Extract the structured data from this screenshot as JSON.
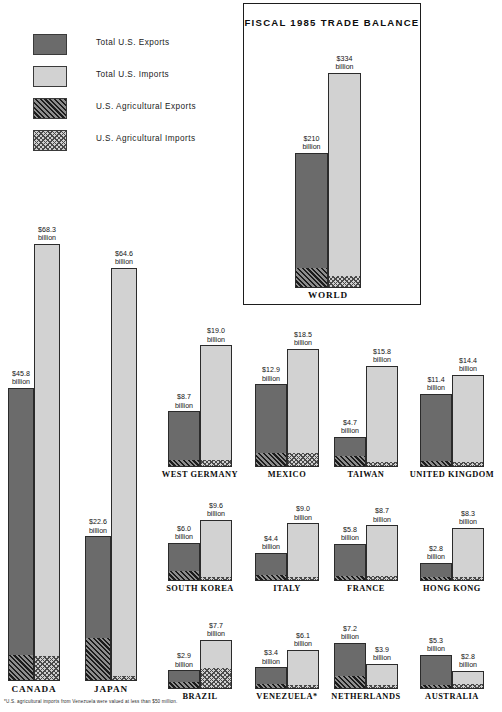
{
  "legend": {
    "items": [
      {
        "label": "Total U.S. Exports",
        "swatch": "exports-swatch",
        "fill": "#6b6b6b"
      },
      {
        "label": "Total U.S. Imports",
        "swatch": "imports-swatch",
        "fill": "#d2d2d2"
      },
      {
        "label": "U.S. Agricultural  Exports",
        "swatch": "ag-exports-swatch",
        "fill": "#5a5a5a"
      },
      {
        "label": "U.S. Agricultural  Imports",
        "swatch": "ag-imports-swatch",
        "fill": "#cfcfcf"
      }
    ]
  },
  "panel": {
    "title": "FISCAL 1985 TRADE BALANCE"
  },
  "footnote": "*U.S. agricultural imports from Venezuela were valued at less than $50 million.",
  "units": "billion",
  "chart_data": {
    "type": "bar",
    "title": "FISCAL 1985 TRADE BALANCE",
    "xlabel": "",
    "ylabel": "U.S. dollars (billions)",
    "grid": false,
    "legend_position": "top-left",
    "series": [
      {
        "name": "Total U.S. Exports"
      },
      {
        "name": "Total U.S. Imports"
      },
      {
        "name": "U.S. Agricultural Exports"
      },
      {
        "name": "U.S. Agricultural Imports"
      }
    ],
    "groups": [
      {
        "name": "WORLD",
        "inset": true,
        "exports": 210.0,
        "imports": 334.0,
        "exports_label": "$210",
        "imports_label": "$334",
        "ag_exports_frac": 0.138,
        "ag_imports_frac": 0.052
      },
      {
        "name": "CANADA",
        "exports": 45.8,
        "imports": 68.3,
        "exports_label": "$45.8",
        "imports_label": "$68.3",
        "ag_exports_frac": 0.085,
        "ag_imports_frac": 0.056
      },
      {
        "name": "JAPAN",
        "exports": 22.6,
        "imports": 64.6,
        "exports_label": "$22.6",
        "imports_label": "$64.6",
        "ag_exports_frac": 0.29,
        "ag_imports_frac": 0.01
      },
      {
        "name": "WEST  GERMANY",
        "exports": 8.7,
        "imports": 19.0,
        "exports_label": "$8.7",
        "imports_label": "$19.0",
        "ag_exports_frac": 0.115,
        "ag_imports_frac": 0.05
      },
      {
        "name": "MEXICO",
        "exports": 12.9,
        "imports": 18.5,
        "exports_label": "$12.9",
        "imports_label": "$18.5",
        "ag_exports_frac": 0.155,
        "ag_imports_frac": 0.11
      },
      {
        "name": "TAIWAN",
        "exports": 4.7,
        "imports": 15.8,
        "exports_label": "$4.7",
        "imports_label": "$15.8",
        "ag_exports_frac": 0.33,
        "ag_imports_frac": 0.035
      },
      {
        "name": "UNITED  KINGDOM",
        "exports": 11.4,
        "imports": 14.4,
        "exports_label": "$11.4",
        "imports_label": "$14.4",
        "ag_exports_frac": 0.075,
        "ag_imports_frac": 0.045
      },
      {
        "name": "SOUTH  KOREA",
        "exports": 6.0,
        "imports": 9.6,
        "exports_label": "$6.0",
        "imports_label": "$9.6",
        "ag_exports_frac": 0.24,
        "ag_imports_frac": 0.035
      },
      {
        "name": "ITALY",
        "exports": 4.4,
        "imports": 9.0,
        "exports_label": "$4.4",
        "imports_label": "$9.0",
        "ag_exports_frac": 0.19,
        "ag_imports_frac": 0.06
      },
      {
        "name": "FRANCE",
        "exports": 5.8,
        "imports": 8.7,
        "exports_label": "$5.8",
        "imports_label": "$8.7",
        "ag_exports_frac": 0.105,
        "ag_imports_frac": 0.08
      },
      {
        "name": "HONG  KONG",
        "exports": 2.8,
        "imports": 8.3,
        "exports_label": "$2.8",
        "imports_label": "$8.3",
        "ag_exports_frac": 0.175,
        "ag_imports_frac": 0.03
      },
      {
        "name": "BRAZIL",
        "exports": 2.9,
        "imports": 7.7,
        "exports_label": "$2.9",
        "imports_label": "$7.7",
        "ag_exports_frac": 0.31,
        "ag_imports_frac": 0.4
      },
      {
        "name": "VENEZUELA*",
        "exports": 3.4,
        "imports": 6.1,
        "exports_label": "$3.4",
        "imports_label": "$6.1",
        "ag_exports_frac": 0.195,
        "ag_imports_frac": 0.012
      },
      {
        "name": "NETHERLANDS",
        "exports": 7.2,
        "imports": 3.9,
        "exports_label": "$7.2",
        "imports_label": "$3.9",
        "ag_exports_frac": 0.255,
        "ag_imports_frac": 0.13
      },
      {
        "name": "AUSTRALIA",
        "exports": 5.3,
        "imports": 2.8,
        "exports_label": "$5.3",
        "imports_label": "$2.8",
        "ag_exports_frac": 0.05,
        "ag_imports_frac": 0.23
      }
    ]
  },
  "layout": {
    "inset": {
      "baseline": 288,
      "scale": 0.645,
      "bar_w": 33,
      "exp_x": 295,
      "imp_x": 328,
      "label_y": 290
    },
    "tall": {
      "baseline": 681,
      "scale": 6.4,
      "bar_w": 26,
      "cols": [
        {
          "exp_x": 8,
          "imp_x": 34
        },
        {
          "exp_x": 85,
          "imp_x": 111
        }
      ],
      "label_y": 684
    },
    "rows": [
      {
        "baseline": 467,
        "label_y": 470
      },
      {
        "baseline": 581,
        "label_y": 584
      },
      {
        "baseline": 689,
        "label_y": 692
      }
    ],
    "grid": {
      "scale": 6.4,
      "bar_w": 32,
      "cols": [
        {
          "exp_x": 168,
          "imp_x": 200
        },
        {
          "exp_x": 255,
          "imp_x": 287
        },
        {
          "exp_x": 334,
          "imp_x": 366
        },
        {
          "exp_x": 420,
          "imp_x": 452
        }
      ]
    }
  }
}
